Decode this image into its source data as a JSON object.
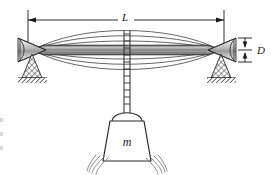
{
  "figure": {
    "background_color": "#ffffff",
    "ink_color": "#1a1a1a",
    "beam_fill_color": "#9a9a9a",
    "beam_edge_color": "#2b2b2b",
    "mode_curve_color": "#444444",
    "hatch_color": "#3a3a3a",
    "motion_line_color": "#777777"
  },
  "labels": {
    "span_label": "L",
    "deflection_label": "D",
    "mass_label": "m"
  },
  "dimensions": {
    "span_line_y": 20,
    "span_left_x": 28,
    "span_right_x": 224,
    "span_label_x": 125,
    "span_label_y": 18,
    "deflection_label_x": 258,
    "deflection_label_y": 54,
    "deflection_top_y": 38,
    "deflection_bottom_y": 62,
    "deflection_center_y": 50,
    "beam_left_support_x": 32,
    "beam_right_support_x": 221,
    "beam_center_y": 50,
    "beam_half_thickness": 5
  },
  "components": [
    {
      "name": "span-dimension-L",
      "kind": "dimension",
      "label": "L"
    },
    {
      "name": "deflection-dimension-D",
      "kind": "dimension",
      "label": "D"
    },
    {
      "name": "vibration-mode-envelope",
      "kind": "curves",
      "count": 6
    },
    {
      "name": "main-beam",
      "kind": "beam"
    },
    {
      "name": "left-knife-edge-support",
      "kind": "support"
    },
    {
      "name": "right-knife-edge-support",
      "kind": "support"
    },
    {
      "name": "left-ground-hatch",
      "kind": "ground"
    },
    {
      "name": "right-ground-hatch",
      "kind": "ground"
    },
    {
      "name": "hanger-rod",
      "kind": "rod"
    },
    {
      "name": "hanging-mass",
      "kind": "mass",
      "label": "m"
    },
    {
      "name": "motion-swoosh-left",
      "kind": "motion"
    },
    {
      "name": "motion-swoosh-right",
      "kind": "motion"
    }
  ],
  "edge_artifacts": [
    {
      "top": 118
    },
    {
      "top": 132
    },
    {
      "top": 146
    }
  ]
}
